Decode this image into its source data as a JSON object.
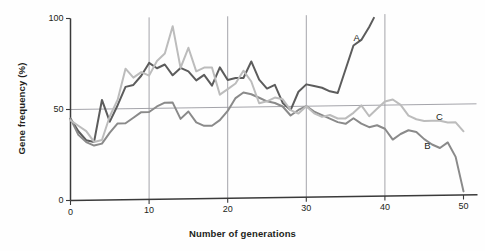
{
  "chart_data": {
    "type": "line",
    "title": "",
    "xlabel": "Number of generations",
    "ylabel": "Gene frequency (%)",
    "xlim": [
      0,
      50
    ],
    "ylim": [
      0,
      100
    ],
    "xticks": [
      "0",
      "10",
      "20",
      "30",
      "40",
      "50"
    ],
    "xtick_values": [
      0,
      10,
      20,
      30,
      40,
      50
    ],
    "yticks": [
      "0",
      "50",
      "100"
    ],
    "ytick_values": [
      0,
      50,
      100
    ],
    "grid": "vertical gridlines at 10,20,30,40 plus horizontal gridline at 50",
    "legend_position": "inline labels at end of each line",
    "colors": {
      "series_a": "#5c5c5c",
      "series_b": "#8a8a8a",
      "series_c": "#bcbcbc",
      "axis": "#3a3a3a",
      "gridline": "#9a9aa0",
      "background": "#fefefe"
    },
    "series": [
      {
        "name": "A",
        "label": "A",
        "color": "#5c5c5c",
        "label_x": 36.5,
        "label_y": 87,
        "x": [
          0,
          1,
          2,
          3,
          4,
          5,
          6,
          7,
          8,
          9,
          10,
          11,
          12,
          13,
          14,
          15,
          16,
          17,
          18,
          19,
          20,
          21,
          22,
          23,
          24,
          25,
          26,
          27,
          28,
          29,
          30,
          31,
          32,
          33,
          34,
          35,
          36,
          37,
          38,
          38.6
        ],
        "values": [
          45,
          38,
          33,
          32,
          55,
          43,
          52,
          62,
          63,
          68,
          75,
          72,
          74,
          68,
          72,
          70,
          65,
          68,
          62,
          72,
          65,
          66,
          66,
          75,
          65,
          60,
          62,
          52,
          48,
          58,
          62,
          61,
          60,
          58,
          57,
          70,
          83,
          86,
          93,
          98
        ]
      },
      {
        "name": "B",
        "label": "B",
        "color": "#8a8a8a",
        "label_x": 45.5,
        "label_y": 27,
        "x": [
          0,
          1,
          2,
          3,
          4,
          5,
          6,
          7,
          8,
          9,
          10,
          11,
          12,
          13,
          14,
          15,
          16,
          17,
          18,
          19,
          20,
          21,
          22,
          23,
          24,
          25,
          26,
          27,
          28,
          29,
          30,
          31,
          32,
          33,
          34,
          35,
          36,
          37,
          38,
          39,
          40,
          41,
          42,
          43,
          44,
          45,
          46,
          47,
          48,
          49,
          50
        ],
        "values": [
          45,
          36,
          32,
          30,
          31,
          37,
          42,
          42,
          45,
          48,
          48,
          51,
          53,
          53,
          44,
          48,
          42,
          40,
          40,
          43,
          48,
          55,
          58,
          57,
          55,
          53,
          52,
          50,
          45,
          48,
          50,
          47,
          45,
          43,
          41,
          40,
          43,
          40,
          38,
          39,
          37,
          31,
          34,
          36,
          35,
          31,
          28,
          26,
          29,
          21,
          2
        ]
      },
      {
        "name": "C",
        "label": "C",
        "color": "#bcbcbc",
        "label_x": 47,
        "label_y": 43,
        "x": [
          0,
          1,
          2,
          3,
          4,
          5,
          6,
          7,
          8,
          9,
          10,
          11,
          12,
          13,
          14,
          15,
          16,
          17,
          18,
          19,
          20,
          21,
          22,
          23,
          24,
          25,
          26,
          27,
          28,
          29,
          30,
          31,
          32,
          33,
          34,
          35,
          36,
          37,
          38,
          39,
          40,
          41,
          42,
          43,
          44,
          45,
          46,
          47,
          48,
          49,
          50
        ],
        "values": [
          44,
          41,
          38,
          32,
          33,
          46,
          55,
          72,
          67,
          70,
          68,
          76,
          80,
          95,
          72,
          83,
          70,
          72,
          72,
          57,
          60,
          63,
          70,
          64,
          52,
          53,
          55,
          54,
          48,
          46,
          50,
          46,
          44,
          45,
          43,
          43,
          46,
          50,
          44,
          48,
          52,
          53,
          50,
          44,
          42,
          41,
          41,
          41,
          40,
          40,
          35
        ]
      }
    ]
  },
  "labels": {
    "y_axis_title": "Gene frequency (%)",
    "x_axis_title": "Number of generations"
  }
}
